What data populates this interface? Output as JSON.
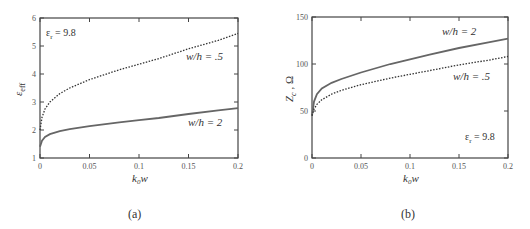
{
  "chart_data": [
    {
      "type": "line",
      "panel": "(a)",
      "title": "",
      "xlabel": "k0w",
      "ylabel": "ε_eff",
      "xlim": [
        0,
        0.2
      ],
      "ylim": [
        1,
        6
      ],
      "xticks": [
        "0",
        "0.05",
        "0.1",
        "0.15",
        "0.2"
      ],
      "yticks": [
        "1",
        "2",
        "3",
        "4",
        "5",
        "6"
      ],
      "grid": false,
      "annotations": [
        "εr = 9.8",
        "w/h = .5",
        "w/h = 2"
      ],
      "x": [
        0,
        0.002,
        0.005,
        0.01,
        0.02,
        0.03,
        0.05,
        0.08,
        0.1,
        0.12,
        0.15,
        0.18,
        0.2
      ],
      "series": [
        {
          "name": "w/h = .5",
          "style": "dotted",
          "values": [
            2.0,
            2.45,
            2.75,
            3.0,
            3.3,
            3.5,
            3.8,
            4.15,
            4.35,
            4.55,
            4.9,
            5.2,
            5.45
          ]
        },
        {
          "name": "w/h = 2",
          "style": "solid",
          "values": [
            1.4,
            1.62,
            1.75,
            1.85,
            1.96,
            2.03,
            2.14,
            2.27,
            2.35,
            2.43,
            2.57,
            2.7,
            2.78
          ]
        }
      ]
    },
    {
      "type": "line",
      "panel": "(b)",
      "title": "",
      "xlabel": "k0w",
      "ylabel": "Zc, Ω",
      "xlim": [
        0,
        0.2
      ],
      "ylim": [
        0,
        150
      ],
      "xticks": [
        "0",
        "0.05",
        "0.1",
        "0.15",
        "0.2"
      ],
      "yticks": [
        "0",
        "50",
        "100",
        "150"
      ],
      "grid": false,
      "annotations": [
        "w/h = 2",
        "w/h = .5",
        "εr = 9.8"
      ],
      "x": [
        0,
        0.002,
        0.005,
        0.01,
        0.02,
        0.03,
        0.05,
        0.08,
        0.1,
        0.12,
        0.15,
        0.18,
        0.2
      ],
      "series": [
        {
          "name": "w/h = 2",
          "style": "solid",
          "values": [
            45,
            60,
            68,
            74,
            80,
            84,
            91,
            100,
            105,
            110,
            117,
            123,
            127
          ]
        },
        {
          "name": "w/h = .5",
          "style": "dotted",
          "values": [
            45,
            52,
            57,
            62,
            68,
            72,
            78,
            85,
            89,
            93,
            99,
            104,
            108
          ]
        }
      ]
    }
  ],
  "panels": {
    "a": {
      "caption": "(a)",
      "xlabel_k": "k",
      "xlabel_sub": "0",
      "xlabel_w": "w",
      "ylabel_main": "ε",
      "ylabel_sub": "eff",
      "er_label": "ε",
      "er_sub": "r",
      "er_value": " = 9.8",
      "label_wh05": "w/h  = .5",
      "label_wh2": "w/h  = 2"
    },
    "b": {
      "caption": "(b)",
      "xlabel_k": "k",
      "xlabel_sub": "0",
      "xlabel_w": "w",
      "ylabel_main": "Z",
      "ylabel_sub": "c",
      "ylabel_unit": " , Ω",
      "er_label": "ε",
      "er_sub": "r",
      "er_value": " = 9.8",
      "label_wh05": "w/h  = .5",
      "label_wh2": "w/h  = 2"
    }
  }
}
